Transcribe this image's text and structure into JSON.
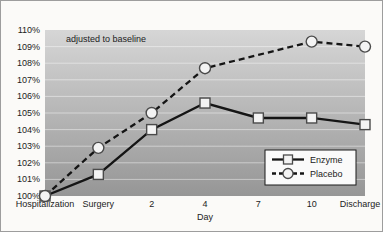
{
  "figure": {
    "frame_color": "#9d9d9d",
    "background": "#fbfaf8"
  },
  "chart_data": {
    "type": "line",
    "title": "",
    "annotation": "adjusted to baseline",
    "xlabel": "Day",
    "ylabel": "",
    "categories": [
      "Hospitalization",
      "Surgery",
      "2",
      "4",
      "7",
      "10",
      "Discharge"
    ],
    "ytick_labels": [
      "100%",
      "101%",
      "102%",
      "103%",
      "104%",
      "105%",
      "106%",
      "107%",
      "108%",
      "109%",
      "110%"
    ],
    "ylim": [
      100,
      110
    ],
    "grid": true,
    "gridline_color": "rgba(255,255,255,0.45)",
    "plot_background": {
      "top": "#d6d6d6",
      "bottom": "#969696"
    },
    "line_color": "#151515",
    "marker_fill": "#f3f3f3",
    "marker_stroke": "#4a4a4a",
    "series": [
      {
        "name": "Enzyme",
        "line_style": "solid",
        "marker": "square",
        "values": [
          100,
          101.3,
          104,
          105.6,
          104.7,
          104.7,
          104.3
        ],
        "markers_visible": [
          true,
          true,
          true,
          true,
          true,
          true,
          true
        ]
      },
      {
        "name": "Placebo",
        "line_style": "dashed",
        "marker": "circle",
        "values": [
          100,
          102.9,
          105,
          107.7,
          108.5,
          109.3,
          109
        ],
        "markers_visible": [
          true,
          true,
          true,
          true,
          false,
          true,
          true
        ]
      }
    ],
    "legend": {
      "position": "bottom-right",
      "entries": [
        "Enzyme",
        "Placebo"
      ]
    }
  }
}
